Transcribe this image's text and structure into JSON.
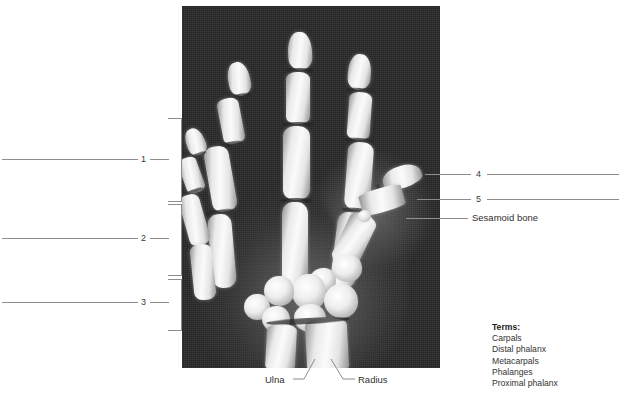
{
  "figure": {
    "kind": "hand-xray-labeling-worksheet",
    "image_label": "radiograph-of-right-hand-and-wrist"
  },
  "numbered_callouts": [
    {
      "id": "1",
      "number": "1",
      "side": "left",
      "bracket": true
    },
    {
      "id": "2",
      "number": "2",
      "side": "left",
      "bracket": true
    },
    {
      "id": "3",
      "number": "3",
      "side": "left",
      "bracket": true
    },
    {
      "id": "4",
      "number": "4",
      "side": "right",
      "bracket": false
    },
    {
      "id": "5",
      "number": "5",
      "side": "right",
      "bracket": false
    }
  ],
  "given_labels": [
    {
      "id": "sesamoid",
      "text": "Sesamoid bone",
      "side": "right"
    },
    {
      "id": "ulna",
      "text": "Ulna",
      "side": "bottom"
    },
    {
      "id": "radius",
      "text": "Radius",
      "side": "bottom"
    }
  ],
  "terms": {
    "title": "Terms:",
    "items": [
      "Carpals",
      "Distal phalanx",
      "Metacarpals",
      "Phalanges",
      "Proximal phalanx"
    ]
  },
  "colors": {
    "page_background": "#ffffff",
    "xray_background": "#2a2a2a",
    "bone_highlight": "#fbfbfb",
    "rule_line": "#8d8d8d",
    "text": "#2f2f2f",
    "terms_title": "#1d1d1d"
  }
}
